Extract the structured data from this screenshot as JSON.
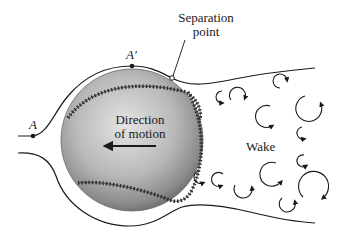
{
  "figure": {
    "labels": {
      "point_a": "A",
      "point_a_prime": "A′",
      "separation_line1": "Separation",
      "separation_line2": "point",
      "direction_line1": "Direction",
      "direction_line2": "of motion",
      "wake": "Wake"
    },
    "colors": {
      "line": "#1a1a1a",
      "ball_light": "#d8d8d8",
      "ball_dark": "#6a6a6a",
      "stitch": "#2a2a2a",
      "background": "#ffffff"
    }
  }
}
